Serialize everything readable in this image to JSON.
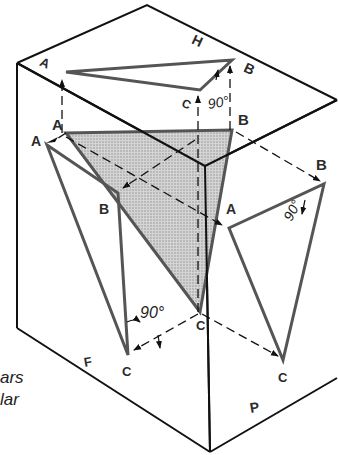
{
  "diagram": {
    "type": "orthographic-projection-box",
    "planes": {
      "horizontal": "H",
      "frontal": "F",
      "profile": "P"
    },
    "points": {
      "h_view": {
        "A": "A",
        "B": "B",
        "C": "C"
      },
      "true_view": {
        "A": "A",
        "B": "B",
        "C": "C"
      },
      "f_view": {
        "A": "A",
        "B": "B",
        "C": "C"
      },
      "p_view": {
        "A": "A",
        "B": "B",
        "C": "C"
      }
    },
    "angles": {
      "h_view": "90°",
      "p_view": "90°",
      "f_view": "90°"
    },
    "caption_fragments": [
      "ars",
      "lar"
    ],
    "colors": {
      "box_line": "#111111",
      "triangle_line": "#555555",
      "shade": "#b8b8b8",
      "label": "#2b2b2b"
    }
  }
}
